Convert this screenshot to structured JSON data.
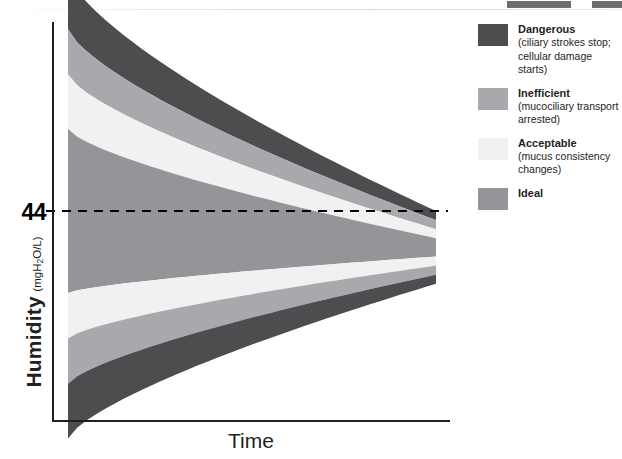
{
  "chart_data": {
    "type": "area",
    "title": "",
    "xlabel": "Time",
    "ylabel": "Humidity",
    "ylabel_unit": "(mgH2O/L)",
    "grid": false,
    "legend_position": "right",
    "reference_line": {
      "value": "44",
      "axis": "y",
      "style": "dashed",
      "color": "#000000"
    },
    "x": [
      "start",
      "end"
    ],
    "series": [
      {
        "name": "Dangerous (upper)",
        "color": "#4d4d4f",
        "y_top": [
          96,
          44
        ],
        "y_bottom": [
          84,
          42
        ]
      },
      {
        "name": "Inefficient (upper)",
        "color": "#a7a9ac",
        "y_top": [
          84,
          42
        ],
        "y_bottom": [
          74,
          40
        ]
      },
      {
        "name": "Acceptable (upper)",
        "color": "#f1f1f2",
        "y_top": [
          74,
          40
        ],
        "y_bottom": [
          62,
          38
        ]
      },
      {
        "name": "Ideal",
        "color": "#939598",
        "y_top": [
          62,
          38
        ],
        "y_bottom": [
          26,
          34
        ]
      },
      {
        "name": "Acceptable (lower)",
        "color": "#f1f1f2",
        "y_top": [
          26,
          34
        ],
        "y_bottom": [
          16,
          32
        ]
      },
      {
        "name": "Inefficient (lower)",
        "color": "#a7a9ac",
        "y_top": [
          16,
          32
        ],
        "y_bottom": [
          6,
          30
        ]
      },
      {
        "name": "Dangerous (lower)",
        "color": "#4d4d4f",
        "y_top": [
          6,
          30
        ],
        "y_bottom": [
          -6,
          28
        ]
      }
    ]
  },
  "axes": {
    "y_label_main": "Humidity",
    "y_label_unit_pre": "(mgH",
    "y_label_unit_sub": "2",
    "y_label_unit_post": "O/L)",
    "x_label": "Time",
    "reference_value": "44"
  },
  "legend": {
    "items": [
      {
        "label": "Dangerous",
        "description": "(ciliary strokes stop; cellular damage starts)",
        "color": "#4d4d4f"
      },
      {
        "label": "Inefficient",
        "description": "(mucociliary transport arrested)",
        "color": "#a7a9ac"
      },
      {
        "label": "Acceptable",
        "description": "(mucus consistency changes)",
        "color": "#f1f1f2"
      },
      {
        "label": "Ideal",
        "description": "",
        "color": "#939598"
      }
    ]
  }
}
